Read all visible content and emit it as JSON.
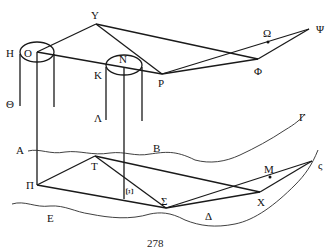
{
  "diagram": {
    "labels": {
      "Y": "Υ",
      "H": "Η",
      "O": "Ο",
      "N": "Ν",
      "K": "Κ",
      "P": "Ρ",
      "Omega": "Ω",
      "Psi": "Ψ",
      "Phi": "Φ",
      "Theta": "Θ",
      "Lambda": "Λ",
      "Gamma": "Γ",
      "A": "Α",
      "B": "Β",
      "T": "Τ",
      "M": "Μ",
      "zeta": "ς",
      "Pi": "Π",
      "Xi": "Ξ",
      "Sigma": "Σ",
      "X": "Χ",
      "E": "Ε",
      "Delta": "Δ"
    },
    "page_number": "278"
  }
}
